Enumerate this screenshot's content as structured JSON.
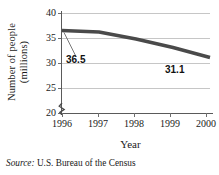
{
  "chart_data": {
    "type": "line",
    "title": "",
    "xlabel": "Year",
    "ylabel_line1": "Number of people",
    "ylabel_line2": "(millions)",
    "x": [
      1996,
      1997,
      1998,
      1999,
      2000
    ],
    "xtick_labels": [
      "1996",
      "1997",
      "1998",
      "1999",
      "2000"
    ],
    "values": [
      36.5,
      36.2,
      34.8,
      33.1,
      31.1
    ],
    "ytick_labels": [
      "40",
      "35",
      "30",
      "25",
      "20"
    ],
    "ytick_values": [
      40,
      35,
      30,
      25,
      20
    ],
    "ylim": [
      20,
      40
    ],
    "xlim": [
      1996,
      2000
    ],
    "grid": "horizontal",
    "legend": "none",
    "axis_break": true,
    "series_color": "#4a4a4a",
    "grid_color": "#c6c6c6",
    "annotations": [
      {
        "text": "36.5",
        "value": 36.5,
        "x": 1996,
        "position": "below-left-with-leader"
      },
      {
        "text": "31.1",
        "value": 31.1,
        "x": 2000,
        "position": "below-right"
      }
    ]
  },
  "source": {
    "key": "Source:",
    "value": "U.S. Bureau of the Census"
  }
}
